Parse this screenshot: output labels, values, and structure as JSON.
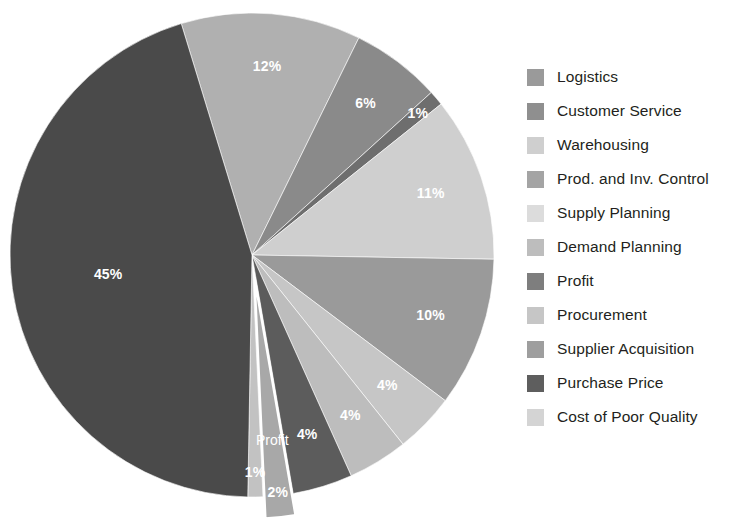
{
  "chart_data": {
    "type": "pie",
    "title": "",
    "subtitle": "",
    "legend_position": "right",
    "start_angle_deg": -17,
    "explode_slice": "Profit",
    "categories": [
      "Warehousing",
      "Prod. and Inv. Control",
      "Supply Planning",
      "Demand Planning",
      "Logistics",
      "Customer Service",
      "Cost of Poor Quality",
      "Procurement",
      "Profit",
      "Supplier Acquisition",
      "Purchase Price"
    ],
    "values": [
      12,
      6,
      1,
      11,
      10,
      4,
      4,
      4,
      2,
      1,
      45
    ],
    "labels": [
      "12%",
      "6%",
      "1%",
      "11%",
      "10%",
      "4%",
      "4%",
      "4%",
      "2%",
      "1%",
      "45%"
    ],
    "colors": [
      "#b0b0b0",
      "#8a8a8a",
      "#6e6e6e",
      "#cfcfcf",
      "#9a9a9a",
      "#c6c6c6",
      "#bdbdbd",
      "#5c5c5c",
      "#a8a8a8",
      "#c2c2c2",
      "#4a4a4a"
    ],
    "annotations": [
      {
        "text": "Profit",
        "for": "Profit"
      }
    ]
  },
  "legend": {
    "items": [
      {
        "label": "Logistics",
        "color": "#9a9a9a"
      },
      {
        "label": "Customer Service",
        "color": "#8f8f8f"
      },
      {
        "label": "Warehousing",
        "color": "#cfcfcf"
      },
      {
        "label": "Prod. and Inv. Control",
        "color": "#a4a4a4"
      },
      {
        "label": "Supply Planning",
        "color": "#dcdcdc"
      },
      {
        "label": "Demand Planning",
        "color": "#bdbdbd"
      },
      {
        "label": "Profit",
        "color": "#7e7e7e"
      },
      {
        "label": "Procurement",
        "color": "#c6c6c6"
      },
      {
        "label": "Supplier Acquisition",
        "color": "#9e9e9e"
      },
      {
        "label": "Purchase Price",
        "color": "#5e5e5e"
      },
      {
        "label": "Cost of Poor Quality",
        "color": "#d4d4d4"
      }
    ]
  }
}
